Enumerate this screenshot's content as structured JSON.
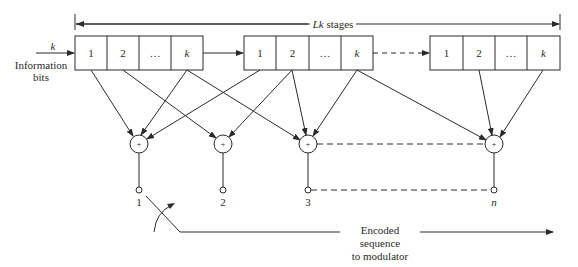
{
  "diagram": {
    "type": "convolutional-encoder",
    "span_label": "Lk stages",
    "input": {
      "symbol": "k",
      "label_line1": "Information",
      "label_line2": "bits"
    },
    "registers": [
      {
        "cells": [
          "1",
          "2",
          "…",
          "k"
        ]
      },
      {
        "cells": [
          "1",
          "2",
          "…",
          "k"
        ]
      },
      {
        "cells": [
          "1",
          "2",
          "…",
          "k"
        ]
      }
    ],
    "adders": [
      {
        "symbol": "+",
        "output_label": "1"
      },
      {
        "symbol": "+",
        "output_label": "2"
      },
      {
        "symbol": "+",
        "output_label": "3"
      },
      {
        "symbol": "+",
        "output_label": "n"
      }
    ],
    "output": {
      "line1": "Encoded",
      "line2": "sequence",
      "line3": "to modulator"
    }
  }
}
